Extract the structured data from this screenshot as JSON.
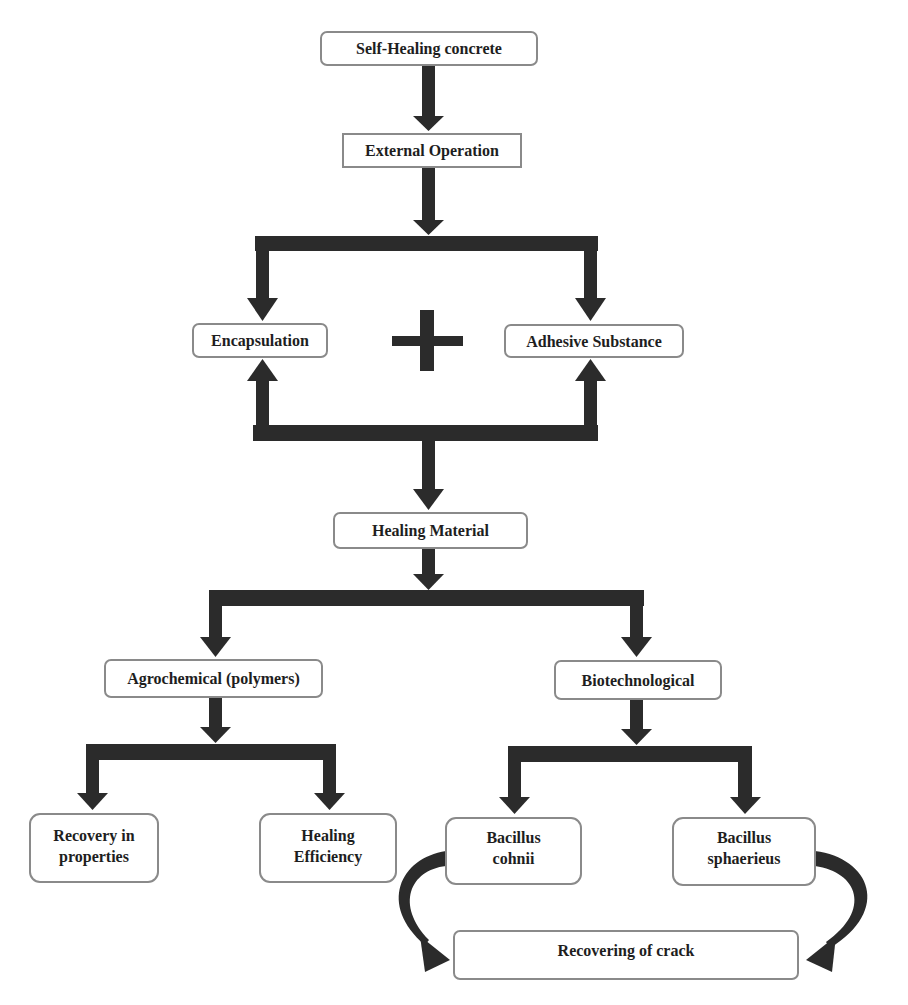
{
  "diagram": {
    "type": "flowchart",
    "arrow_color": "#2b2b2b",
    "border_color": "#8a8a8a",
    "nodes": {
      "self_healing_concrete": "Self-Healing concrete",
      "external_operation": "External Operation",
      "encapsulation": "Encapsulation",
      "plus_symbol": "+",
      "adhesive_substance": "Adhesive Substance",
      "healing_material": "Healing Material",
      "agrochemical": "Agrochemical (polymers)",
      "biotechnological": "Biotechnological",
      "recovery_in_properties": {
        "line1": "Recovery in",
        "line2": "properties"
      },
      "healing_efficiency": {
        "line1": "Healing",
        "line2": "Efficiency"
      },
      "bacillus_cohnii": {
        "line1": "Bacillus",
        "line2": "cohnii"
      },
      "bacillus_sphaerieus": {
        "line1": "Bacillus",
        "line2": "sphaerieus"
      },
      "recovering_of_crack": "Recovering of crack"
    },
    "edges": [
      {
        "from": "Self-Healing concrete",
        "to": "External Operation"
      },
      {
        "from": "External Operation",
        "to": "Encapsulation"
      },
      {
        "from": "External Operation",
        "to": "Adhesive Substance"
      },
      {
        "from": "Encapsulation + Adhesive Substance",
        "to": "Healing Material"
      },
      {
        "from": "Healing Material",
        "to": "Agrochemical (polymers)"
      },
      {
        "from": "Healing Material",
        "to": "Biotechnological"
      },
      {
        "from": "Agrochemical (polymers)",
        "to": "Recovery in properties"
      },
      {
        "from": "Agrochemical (polymers)",
        "to": "Healing Efficiency"
      },
      {
        "from": "Biotechnological",
        "to": "Bacillus cohnii"
      },
      {
        "from": "Biotechnological",
        "to": "Bacillus sphaerieus"
      },
      {
        "from": "Bacillus cohnii",
        "to": "Recovering of crack"
      },
      {
        "from": "Bacillus sphaerieus",
        "to": "Recovering of crack"
      }
    ]
  }
}
